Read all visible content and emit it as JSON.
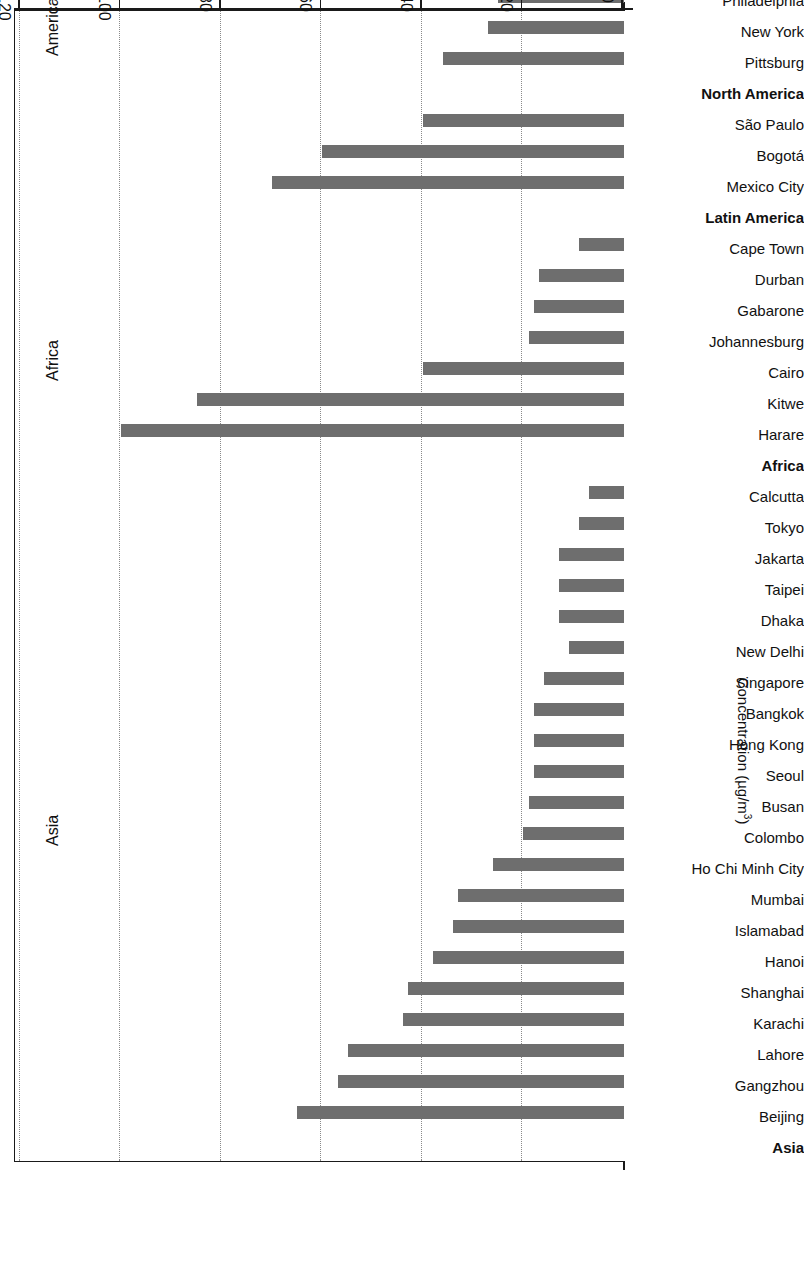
{
  "chart_data": {
    "type": "bar",
    "orientation": "horizontal",
    "title": "",
    "xlabel": "Concentration (µg/m³)",
    "ylabel": "",
    "xlim": [
      0,
      120
    ],
    "xticks": [
      0,
      20,
      40,
      60,
      80,
      100,
      120
    ],
    "xtick_labels": [
      "0",
      "20",
      "40",
      "60",
      "80",
      "100",
      "120"
    ],
    "grid": true,
    "legend": false,
    "bar_color": "#6e6e6e",
    "axis_color": "#1a1a1a",
    "unit": "µg/m³",
    "regions": [
      "Asia",
      "Africa",
      "Americas",
      "Europe"
    ],
    "categories": [
      "Asia",
      "Beijing",
      "Gangzhou",
      "Lahore",
      "Karachi",
      "Shanghai",
      "Hanoi",
      "Islamabad",
      "Mumbai",
      "Ho Chi Minh City",
      "Colombo",
      "Busan",
      "Seoul",
      "Hong Kong",
      "Bangkok",
      "Singapore",
      "New Delhi",
      "Dhaka",
      "Taipei",
      "Jakarta",
      "Tokyo",
      "Calcutta",
      "Africa",
      "Harare",
      "Kitwe",
      "Cairo",
      "Johannesburg",
      "Gabarone",
      "Durban",
      "Cape Town",
      "Latin America",
      "Mexico City",
      "Bogotá",
      "São Paulo",
      "North America",
      "Pittsburg",
      "New York",
      "Philadelphia",
      "Washington, DC",
      "Los Angles",
      "Seattle",
      "Vancouver",
      "Montreal",
      "Europe",
      "Sofia",
      "Athens",
      "Brussels",
      "Berlin",
      "Kiel",
      "Oslo",
      "Barcelona",
      "Copenhagen"
    ],
    "group_headers": [
      "Asia",
      "Africa",
      "Latin America",
      "North America",
      "Europe"
    ],
    "values": [
      null,
      65,
      57,
      55,
      44,
      43,
      38,
      34,
      33,
      26,
      20,
      19,
      18,
      18,
      18,
      16,
      11,
      13,
      13,
      13,
      9,
      7,
      null,
      100,
      85,
      40,
      19,
      18,
      17,
      9,
      null,
      70,
      60,
      40,
      null,
      36,
      27,
      25,
      23,
      11,
      10,
      16,
      10,
      null,
      35,
      30,
      17,
      10,
      12,
      9,
      10,
      8
    ]
  },
  "axis": {
    "title_main": "Concentration (µg/m",
    "title_sup": "3",
    "title_close": ")"
  },
  "regions": [
    {
      "name": "Asia"
    },
    {
      "name": "Africa"
    },
    {
      "name": "Americas"
    },
    {
      "name": "Europe"
    }
  ]
}
